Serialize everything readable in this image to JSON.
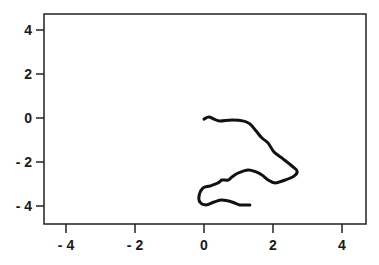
{
  "chart_data": {
    "type": "line",
    "title": "",
    "xlabel": "",
    "ylabel": "",
    "xlim": [
      -4.7,
      4.6
    ],
    "ylim": [
      -4.8,
      4.8
    ],
    "grid": false,
    "legend": null,
    "xticks": [
      -4,
      -2,
      0,
      2,
      4
    ],
    "yticks": [
      4,
      2,
      0,
      -2,
      -4
    ],
    "xtick_labels": [
      "- 4",
      "- 2",
      "0",
      "2",
      "4"
    ],
    "ytick_labels": [
      "4",
      "2",
      "0",
      "- 2",
      "- 4"
    ],
    "series": [
      {
        "name": "trajectory",
        "color": "#111111",
        "x": [
          0.0,
          0.14,
          0.29,
          0.46,
          0.81,
          1.16,
          1.33,
          1.51,
          1.68,
          1.86,
          2.03,
          2.29,
          2.55,
          2.7,
          2.61,
          2.35,
          2.06,
          1.86,
          1.68,
          1.51,
          1.28,
          0.99,
          0.81,
          0.7,
          0.52,
          0.41,
          0.17,
          -0.03,
          -0.14,
          -0.12,
          0.06,
          0.29,
          0.52,
          0.81,
          1.04,
          1.33
        ],
        "y": [
          -0.05,
          0.05,
          -0.05,
          -0.14,
          -0.09,
          -0.14,
          -0.27,
          -0.59,
          -0.91,
          -1.14,
          -1.55,
          -1.86,
          -2.18,
          -2.41,
          -2.64,
          -2.82,
          -2.95,
          -2.82,
          -2.59,
          -2.45,
          -2.36,
          -2.5,
          -2.68,
          -2.82,
          -2.82,
          -2.95,
          -3.09,
          -3.18,
          -3.5,
          -3.82,
          -3.95,
          -3.82,
          -3.73,
          -3.82,
          -3.95,
          -3.95
        ]
      }
    ]
  }
}
